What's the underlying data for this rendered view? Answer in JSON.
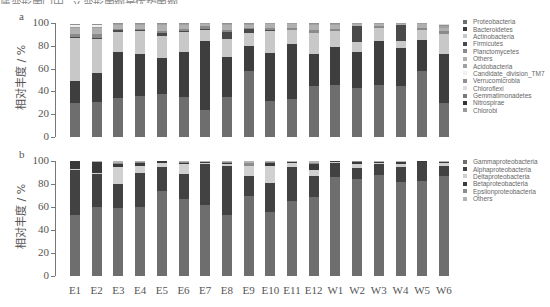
{
  "header": {
    "truncated_text": "属变形菌门中，γ-变形菌纲是优势菌纲"
  },
  "chart_data": [
    {
      "type": "bar",
      "stacked": true,
      "panel_label": "a",
      "title": "",
      "xlabel": "",
      "ylabel": "相对丰度 / %",
      "ylim": [
        0,
        100
      ],
      "yticks": [
        0,
        20,
        40,
        60,
        80,
        100
      ],
      "grid": false,
      "legend_position": "right",
      "categories": [
        "E1",
        "E2",
        "E3",
        "E4",
        "E5",
        "E6",
        "E7",
        "E8",
        "E9",
        "E10",
        "E11",
        "E12",
        "W1",
        "W2",
        "W3",
        "W4",
        "W5",
        "W6"
      ],
      "series": [
        {
          "name": "Proteobacteria",
          "color": "#6e6e6e",
          "values": [
            30,
            31,
            34,
            36,
            38,
            35,
            24,
            35,
            58,
            32,
            33,
            45,
            46,
            43,
            46,
            45,
            58,
            30
          ]
        },
        {
          "name": "Bacteroidetes",
          "color": "#3e3e3e",
          "values": [
            19,
            25,
            41,
            37,
            31,
            40,
            60,
            35,
            22,
            42,
            49,
            28,
            33,
            32,
            38,
            33,
            27,
            43
          ]
        },
        {
          "name": "Actinobacteria",
          "color": "#c8c8c8",
          "values": [
            38,
            30,
            17,
            20,
            20,
            17,
            10,
            16,
            11,
            19,
            12,
            18,
            14,
            8,
            12,
            6,
            9,
            17
          ]
        },
        {
          "name": "Firmicutes",
          "color": "#4a4a4a",
          "values": [
            1,
            1,
            2,
            1,
            2,
            1,
            1,
            6,
            4,
            1,
            0,
            0,
            0,
            14,
            0,
            14,
            0,
            0
          ]
        },
        {
          "name": "Planctomycetes",
          "color": "#8a8a8a",
          "values": [
            2,
            3,
            1,
            1,
            2,
            2,
            2,
            2,
            1,
            2,
            2,
            3,
            2,
            0,
            1,
            0,
            2,
            3
          ]
        },
        {
          "name": "Others",
          "color": "#b0b0b0",
          "values": [
            6,
            6,
            3,
            3,
            5,
            3,
            2,
            4,
            2,
            3,
            3,
            4,
            3,
            2,
            2,
            1,
            3,
            3
          ]
        },
        {
          "name": "Acidobacteria",
          "color": "#a0a0a0",
          "values": [
            1,
            1,
            1,
            1,
            1,
            1,
            1,
            1,
            1,
            1,
            1,
            1,
            1,
            1,
            1,
            1,
            1,
            1
          ]
        },
        {
          "name": "Candidate_division_TM7",
          "color": "#f0f0f0",
          "values": [
            1,
            1,
            0,
            0,
            0,
            0,
            0,
            0,
            0,
            0,
            0,
            0,
            0,
            0,
            0,
            0,
            0,
            0
          ]
        },
        {
          "name": "Verrucomicrobia",
          "color": "#909090",
          "values": [
            1,
            1,
            1,
            1,
            1,
            1,
            0,
            1,
            1,
            0,
            0,
            1,
            1,
            0,
            0,
            0,
            0,
            1
          ]
        },
        {
          "name": "Chloroflexi",
          "color": "#dcdcdc",
          "values": [
            0,
            0,
            0,
            0,
            0,
            0,
            0,
            0,
            0,
            0,
            0,
            0,
            0,
            0,
            0,
            0,
            0,
            1
          ]
        },
        {
          "name": "Gemmatimonadetes",
          "color": "#7a7a7a",
          "values": [
            0,
            0,
            0,
            0,
            0,
            0,
            0,
            0,
            0,
            0,
            0,
            0,
            0,
            0,
            0,
            0,
            0,
            0
          ]
        },
        {
          "name": "Nitrospirae",
          "color": "#333333",
          "values": [
            0,
            0,
            0,
            0,
            0,
            0,
            0,
            0,
            0,
            0,
            0,
            0,
            0,
            0,
            0,
            0,
            0,
            0
          ]
        },
        {
          "name": "Chlorobi",
          "color": "#999999",
          "values": [
            0,
            0,
            0,
            0,
            0,
            0,
            0,
            0,
            0,
            0,
            0,
            0,
            0,
            0,
            0,
            0,
            0,
            0
          ]
        }
      ]
    },
    {
      "type": "bar",
      "stacked": true,
      "panel_label": "b",
      "title": "",
      "xlabel": "",
      "ylabel": "相对丰度 / %",
      "ylim": [
        0,
        100
      ],
      "yticks": [
        0,
        20,
        40,
        60,
        80,
        100
      ],
      "grid": false,
      "legend_position": "right",
      "categories": [
        "E1",
        "E2",
        "E3",
        "E4",
        "E5",
        "E6",
        "E7",
        "E8",
        "E9",
        "E10",
        "E11",
        "E12",
        "W1",
        "W2",
        "W3",
        "W4",
        "W5",
        "W6"
      ],
      "series": [
        {
          "name": "Gammaproteobacteria",
          "color": "#6e6e6e",
          "values": [
            53,
            60,
            59,
            60,
            74,
            67,
            62,
            53,
            70,
            56,
            65,
            69,
            86,
            84,
            88,
            82,
            83,
            87
          ]
        },
        {
          "name": "Alphaproteobacteria",
          "color": "#424242",
          "values": [
            39,
            29,
            21,
            30,
            21,
            22,
            35,
            43,
            17,
            25,
            30,
            18,
            12,
            10,
            9,
            13,
            16,
            9
          ]
        },
        {
          "name": "Deltaproteobacteria",
          "color": "#d0d0d0",
          "values": [
            1,
            1,
            15,
            6,
            3,
            8,
            1,
            1,
            9,
            15,
            3,
            5,
            1,
            3,
            1,
            2,
            0,
            2
          ]
        },
        {
          "name": "Betaproteobacteria",
          "color": "#3a3a3a",
          "values": [
            7,
            9,
            2,
            2,
            2,
            1,
            1,
            1,
            0,
            2,
            1,
            5,
            1,
            2,
            1,
            2,
            1,
            1
          ]
        },
        {
          "name": "Epsilonproteobacteria",
          "color": "#8c8c8c",
          "values": [
            0,
            0,
            1,
            1,
            0,
            1,
            0,
            1,
            2,
            1,
            0,
            1,
            0,
            1,
            0,
            0,
            0,
            0
          ]
        },
        {
          "name": "Others",
          "color": "#b4b4b4",
          "values": [
            0,
            1,
            2,
            1,
            0,
            1,
            1,
            1,
            2,
            1,
            1,
            2,
            0,
            0,
            1,
            1,
            0,
            1
          ]
        }
      ]
    }
  ]
}
